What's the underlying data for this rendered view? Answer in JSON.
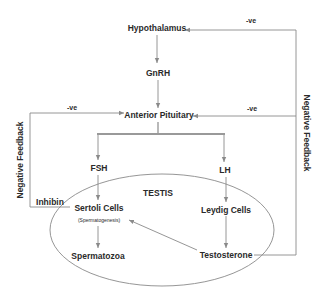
{
  "diagram": {
    "nodes": {
      "hypothalamus": "Hypothalamus",
      "gnrh": "GnRH",
      "anterior_pituitary": "Anterior Pituitary",
      "fsh": "FSH",
      "lh": "LH",
      "testis": "TESTIS",
      "sertoli_cells": "Sertoli Cells",
      "spermatogenesis": "(Spermatogenesis)",
      "leydig_cells": "Leydig Cells",
      "spermatozoa": "Spermatozoa",
      "testosterone": "Testosterone",
      "inhibin": "Inhibin"
    },
    "labels": {
      "neg_top": "-ve",
      "neg_left": "-ve",
      "neg_right": "-ve",
      "neg_feedback_left": "Negative Feedback",
      "neg_feedback_right": "Negative Feedback"
    },
    "colors": {
      "line": "#8a8a8a",
      "text": "#2a2a2a",
      "bracket": "#999999"
    }
  }
}
